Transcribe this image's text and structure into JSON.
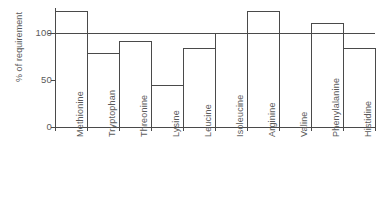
{
  "chart_data": {
    "type": "bar",
    "title": "",
    "subtitle": "",
    "xlabel": "",
    "ylabel": "% of requirement",
    "categories": [
      "Methionine",
      "Tryptophan",
      "Threonine",
      "Lysine",
      "Leucine",
      "Isoleucine",
      "Arginine",
      "Valine",
      "Phenylalanine",
      "Histidine"
    ],
    "values": [
      123,
      78,
      91,
      44,
      84,
      100,
      123,
      100,
      110,
      83
    ],
    "ylim": [
      0,
      130
    ],
    "yticks": [
      0,
      50,
      100
    ],
    "ytick_labels": [
      "0",
      "50",
      "100"
    ],
    "grid": false,
    "legend": null,
    "bar_style": "outline",
    "bar_fill": "#ffffff",
    "bar_stroke": "#4a4a4a",
    "reference_lines": [
      {
        "name": "requirement-line",
        "value": 100,
        "color": "#4a4a4a"
      }
    ],
    "axis_color": "#4a4a4a"
  }
}
